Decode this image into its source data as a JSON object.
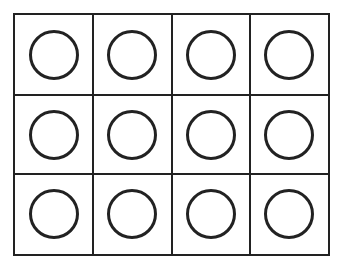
{
  "diagram": {
    "type": "grid-of-circles",
    "rows": 3,
    "columns": 4,
    "cells": [
      {
        "row": 0,
        "col": 0,
        "shape": "circle"
      },
      {
        "row": 0,
        "col": 1,
        "shape": "circle"
      },
      {
        "row": 0,
        "col": 2,
        "shape": "circle"
      },
      {
        "row": 0,
        "col": 3,
        "shape": "circle"
      },
      {
        "row": 1,
        "col": 0,
        "shape": "circle"
      },
      {
        "row": 1,
        "col": 1,
        "shape": "circle"
      },
      {
        "row": 1,
        "col": 2,
        "shape": "circle"
      },
      {
        "row": 1,
        "col": 3,
        "shape": "circle"
      },
      {
        "row": 2,
        "col": 0,
        "shape": "circle"
      },
      {
        "row": 2,
        "col": 1,
        "shape": "circle"
      },
      {
        "row": 2,
        "col": 2,
        "shape": "circle"
      },
      {
        "row": 2,
        "col": 3,
        "shape": "circle"
      }
    ],
    "colors": {
      "stroke": "#222222",
      "background": "#ffffff"
    }
  }
}
